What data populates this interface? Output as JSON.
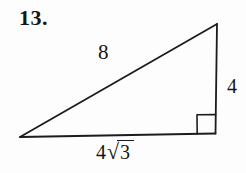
{
  "figure": {
    "problem_number": "13.",
    "shape": "right-triangle",
    "right_angle_marker": true,
    "labels": {
      "hypotenuse": "8",
      "vertical_side": "4",
      "base_coefficient": "4",
      "radical_sign": "√",
      "base_radicand": "3"
    },
    "colors": {
      "ink": "#1c1c1c",
      "background": "#fdfdfd"
    }
  }
}
